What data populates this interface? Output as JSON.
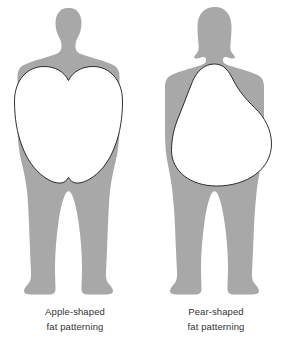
{
  "figure": {
    "background_color": "#ffffff",
    "silhouette_color": "#a8a8a8",
    "overlay_fill_color": "#ffffff",
    "overlay_stroke_color": "#1a1a1a",
    "caption_color": "#333333"
  },
  "panels": [
    {
      "id": "apple",
      "silhouette_name": "male-silhouette",
      "overlay_name": "apple-shape-overlay",
      "overlay_shape": "apple",
      "caption": {
        "line1": "Apple-shaped",
        "line2": "fat patterning",
        "center_x": 75,
        "line1_y": 315,
        "line2_y": 330
      }
    },
    {
      "id": "pear",
      "silhouette_name": "female-silhouette",
      "overlay_name": "pear-shape-overlay",
      "overlay_shape": "pear",
      "caption": {
        "line1": "Pear-shaped",
        "line2": "fat patterning",
        "center_x": 216,
        "line1_y": 315,
        "line2_y": 330
      }
    }
  ]
}
